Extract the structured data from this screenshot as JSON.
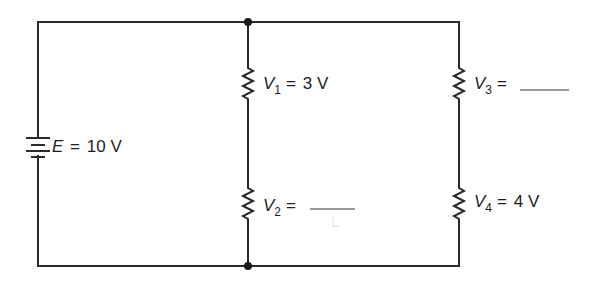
{
  "diagram": {
    "type": "circuit-schematic",
    "colors": {
      "wire": "#2a2a2a",
      "background": "#ffffff",
      "text": "#1e1e1e"
    },
    "source": {
      "symbol": "E",
      "equals": "=",
      "value": "10 V",
      "icon": "battery-icon"
    },
    "branches": [
      {
        "name": "middle-branch",
        "resistors": [
          {
            "id": "R1",
            "symbol": "V",
            "subscript": "1",
            "equals": "=",
            "value": "3 V",
            "unknown": false
          },
          {
            "id": "R2",
            "symbol": "V",
            "subscript": "2",
            "equals": "=",
            "value": "",
            "unknown": true
          }
        ]
      },
      {
        "name": "right-branch",
        "resistors": [
          {
            "id": "R3",
            "symbol": "V",
            "subscript": "3",
            "equals": "=",
            "value": "",
            "unknown": true
          },
          {
            "id": "R4",
            "symbol": "V",
            "subscript": "4",
            "equals": "=",
            "value": "4 V",
            "unknown": false
          }
        ]
      }
    ],
    "junctions": [
      {
        "position": "top",
        "x": 248,
        "y": 22
      },
      {
        "position": "bottom",
        "x": 248,
        "y": 266
      }
    ]
  }
}
